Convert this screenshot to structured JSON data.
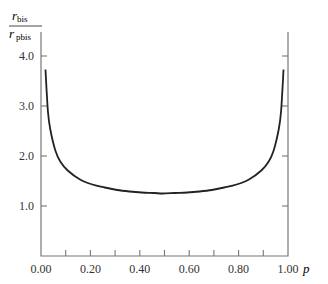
{
  "chart_data": {
    "type": "line",
    "title": "",
    "xlabel": "p",
    "ylabel": "r_bis / r_pbis",
    "ylabel_numerator": "r",
    "ylabel_numerator_sub": "bis",
    "ylabel_denominator": "r",
    "ylabel_denominator_sub": "pbis",
    "xlim": [
      0.0,
      1.0
    ],
    "ylim": [
      0.0,
      4.2
    ],
    "x_ticks": [
      0.0,
      0.1,
      0.2,
      0.3,
      0.4,
      0.5,
      0.6,
      0.7,
      0.8,
      0.9,
      1.0
    ],
    "x_tick_labels": [
      "0.00",
      "0.20",
      "0.40",
      "0.60",
      "0.80",
      "1.00"
    ],
    "x_tick_label_values": [
      0.0,
      0.2,
      0.4,
      0.6,
      0.8,
      1.0
    ],
    "y_ticks": [
      1.0,
      2.0,
      3.0,
      4.0
    ],
    "y_tick_labels": [
      "1.0",
      "2.0",
      "3.0",
      "4.0"
    ],
    "grid": false,
    "legend": null,
    "series": [
      {
        "name": "r_bis / r_pbis",
        "x": [
          0.01,
          0.02,
          0.03,
          0.05,
          0.07,
          0.1,
          0.15,
          0.2,
          0.25,
          0.3,
          0.35,
          0.4,
          0.45,
          0.5,
          0.55,
          0.6,
          0.65,
          0.7,
          0.75,
          0.8,
          0.85,
          0.9,
          0.93,
          0.95,
          0.97,
          0.98,
          0.99
        ],
        "y": [
          3.73,
          2.89,
          2.52,
          2.11,
          1.89,
          1.71,
          1.53,
          1.43,
          1.37,
          1.32,
          1.29,
          1.27,
          1.26,
          1.25,
          1.26,
          1.27,
          1.29,
          1.32,
          1.37,
          1.43,
          1.53,
          1.71,
          1.89,
          2.11,
          2.52,
          2.89,
          3.73
        ]
      }
    ]
  }
}
